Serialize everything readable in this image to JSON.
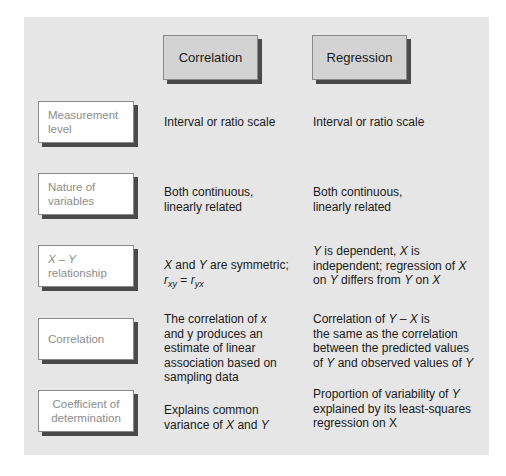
{
  "columns": {
    "correlation": "Correlation",
    "regression": "Regression"
  },
  "rows": [
    {
      "label_line1": "Measurement",
      "label_line2": "level",
      "correlation": "Interval or ratio scale",
      "regression": "Interval or ratio scale"
    },
    {
      "label_line1": "Nature of",
      "label_line2": "variables",
      "correlation_line1": "Both continuous,",
      "correlation_line2": "linearly related",
      "regression_line1": "Both continuous,",
      "regression_line2": "linearly related"
    },
    {
      "label_line1": "X – Y",
      "label_line2": "relationship",
      "correlation": {
        "x": "X",
        "and": " and ",
        "y": "Y",
        "rest": " are symmetric;",
        "r1": "r",
        "sub1": "xy",
        "eq": " = ",
        "r2": "r",
        "sub2": "yx"
      },
      "regression": {
        "y1": "Y",
        "t1": " is dependent, ",
        "x1": "X",
        "t2": " is",
        "t3": "independent; regression of ",
        "x2": "X",
        "t4": "on ",
        "y2": "Y",
        "t5": " differs from ",
        "y3": "Y",
        "t6": " on ",
        "x3": "X"
      }
    },
    {
      "label": "Correlation",
      "correlation_lines": [
        "The correlation of ",
        "x",
        "and y produces an",
        "estimate of linear",
        "association based on",
        "sampling data"
      ],
      "regression": {
        "t1": "Correlation of ",
        "y1": "Y",
        "dash": " – ",
        "x1": "X",
        "t2": " is",
        "line2": "the same as the correlation",
        "line3": "between the predicted values",
        "t3": "of ",
        "y2": "Y",
        "t4": " and observed values of ",
        "y3": "Y"
      }
    },
    {
      "label_line1": "Coefficient of",
      "label_line2": "determination",
      "correlation": {
        "line1": "Explains common",
        "t1": "variance of ",
        "x": "X",
        "and": " and ",
        "y": "Y"
      },
      "regression": {
        "t1": "Proportion of variability of ",
        "y": "Y",
        "line2": "explained by its least-squares",
        "line3": "regression on X"
      }
    }
  ]
}
